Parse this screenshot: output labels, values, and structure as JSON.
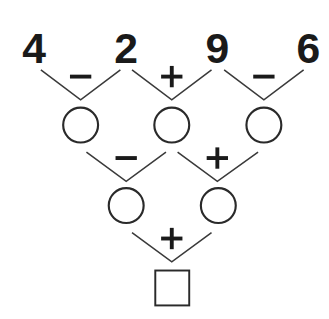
{
  "puzzle": {
    "numbers": [
      "4",
      "2",
      "9",
      "6"
    ],
    "row1_operators": [
      "minus",
      "plus",
      "minus"
    ],
    "row2_operators": [
      "minus",
      "plus"
    ],
    "row3_operators": [
      "plus"
    ],
    "row1_blanks": [
      "",
      "",
      ""
    ],
    "row2_blanks": [
      "",
      ""
    ],
    "result_blank": ""
  },
  "colors": {
    "ink": "#1a1a1a",
    "line": "#3a3a3a",
    "background": "#ffffff"
  }
}
